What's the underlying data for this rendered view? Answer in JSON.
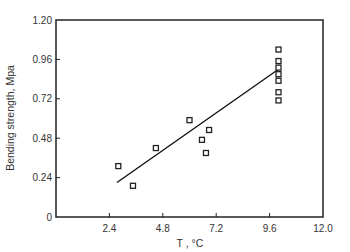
{
  "chart_data": {
    "type": "scatter",
    "title": "",
    "xlabel": "T , °C",
    "ylabel": "Bending strength, Mpa",
    "xlim": [
      0,
      12.0
    ],
    "ylim": [
      0,
      1.2
    ],
    "x_ticks": [
      2.4,
      4.8,
      7.2,
      9.6,
      12.0
    ],
    "x_tick_labels": [
      "2.4",
      "4.8",
      "7.2",
      "9.6",
      "12.0"
    ],
    "y_ticks": [
      0,
      0.24,
      0.48,
      0.72,
      0.96,
      1.2
    ],
    "y_tick_labels": [
      "0",
      "0.24",
      "0.48",
      "0.72",
      "0.96",
      "1.20"
    ],
    "grid": false,
    "legend": null,
    "marker": "open-square",
    "series": [
      {
        "name": "Measured",
        "points": [
          {
            "x": 2.8,
            "y": 0.31
          },
          {
            "x": 3.46,
            "y": 0.19
          },
          {
            "x": 4.49,
            "y": 0.42
          },
          {
            "x": 6.0,
            "y": 0.59
          },
          {
            "x": 6.88,
            "y": 0.53
          },
          {
            "x": 6.56,
            "y": 0.47
          },
          {
            "x": 6.74,
            "y": 0.39
          },
          {
            "x": 10.0,
            "y": 1.02
          },
          {
            "x": 10.0,
            "y": 0.95
          },
          {
            "x": 10.0,
            "y": 0.91
          },
          {
            "x": 10.0,
            "y": 0.87
          },
          {
            "x": 10.0,
            "y": 0.83
          },
          {
            "x": 10.0,
            "y": 0.76
          },
          {
            "x": 10.0,
            "y": 0.71
          }
        ]
      }
    ],
    "fit_line": {
      "x0": 2.74,
      "y0": 0.21,
      "x1": 10.0,
      "y1": 0.9
    }
  },
  "colors": {
    "axis": "#222222",
    "marker": "#222222",
    "line": "#111111",
    "text": "#333333"
  }
}
